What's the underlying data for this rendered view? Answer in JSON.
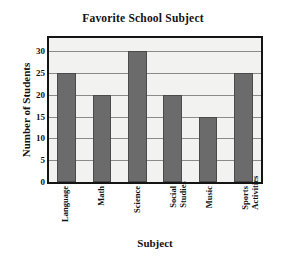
{
  "chart_data": {
    "type": "bar",
    "title": "Favorite School Subject",
    "xlabel": "Subject",
    "ylabel": "Number of Students",
    "categories": [
      "Language",
      "Math",
      "Science",
      "Social Studies",
      "Music",
      "Sports Activities"
    ],
    "category_lines": [
      [
        "Language"
      ],
      [
        "Math"
      ],
      [
        "Science"
      ],
      [
        "Social",
        "Studies"
      ],
      [
        "Music"
      ],
      [
        "Sports",
        "Activities"
      ]
    ],
    "values": [
      25,
      20,
      30,
      20,
      15,
      25
    ],
    "ylim": [
      0,
      33
    ],
    "yticks": [
      0,
      5,
      10,
      15,
      20,
      25,
      30
    ],
    "ytick_labels": [
      "0",
      "5",
      "10",
      "15",
      "20",
      "25",
      "30"
    ],
    "grid": true,
    "legend": false,
    "colors": {
      "bar_fill": "#6b6b6b",
      "bar_edge": "#4a4a4a",
      "plot_background": "#f2f2f0",
      "plot_border": "#141414",
      "gridline": "#8a8a8a",
      "page_background": "#ffffff",
      "text": "#111111"
    }
  }
}
